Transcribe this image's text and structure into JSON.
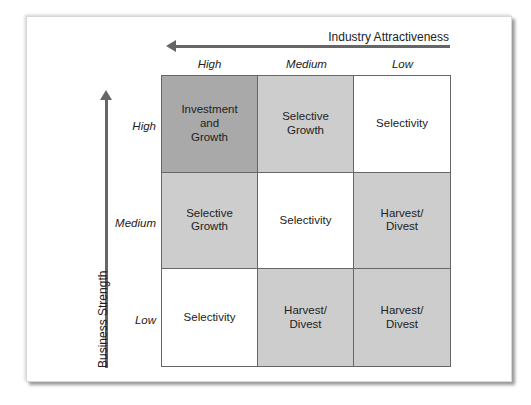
{
  "x_axis": {
    "title": "Industry Attractiveness",
    "direction": "arrow-left",
    "labels": [
      "High",
      "Medium",
      "Low"
    ]
  },
  "y_axis": {
    "title": "Business Strength",
    "direction": "arrow-up",
    "labels": [
      "High",
      "Medium",
      "Low"
    ]
  },
  "colors": {
    "dark": "#a9a9a9",
    "medium": "#cdcdcd",
    "white": "#ffffff",
    "border": "#666666",
    "arrow": "#666666"
  },
  "cells": [
    {
      "row": "High",
      "col": "High",
      "label": "Investment\nand\nGrowth",
      "shade": "#a9a9a9"
    },
    {
      "row": "High",
      "col": "Medium",
      "label": "Selective\nGrowth",
      "shade": "#cdcdcd"
    },
    {
      "row": "High",
      "col": "Low",
      "label": "Selectivity",
      "shade": "#ffffff"
    },
    {
      "row": "Medium",
      "col": "High",
      "label": "Selective\nGrowth",
      "shade": "#cdcdcd"
    },
    {
      "row": "Medium",
      "col": "Medium",
      "label": "Selectivity",
      "shade": "#ffffff"
    },
    {
      "row": "Medium",
      "col": "Low",
      "label": "Harvest/\nDivest",
      "shade": "#cdcdcd"
    },
    {
      "row": "Low",
      "col": "High",
      "label": "Selectivity",
      "shade": "#ffffff"
    },
    {
      "row": "Low",
      "col": "Medium",
      "label": "Harvest/\nDivest",
      "shade": "#cdcdcd"
    },
    {
      "row": "Low",
      "col": "Low",
      "label": "Harvest/\nDivest",
      "shade": "#cdcdcd"
    }
  ]
}
